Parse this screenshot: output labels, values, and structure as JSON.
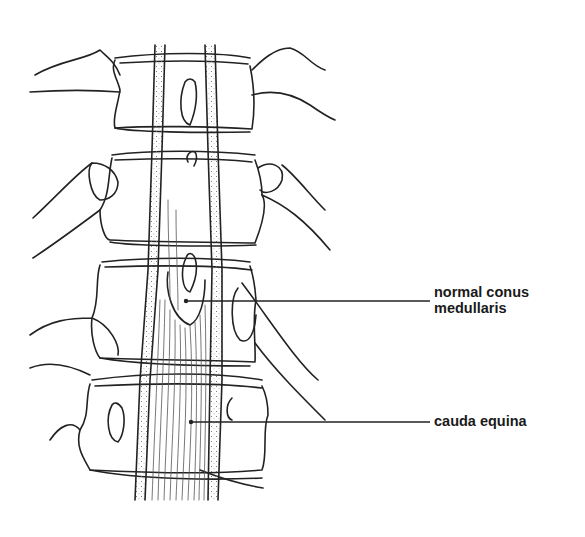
{
  "diagram": {
    "labels": [
      {
        "id": "conus",
        "line1": "normal conus",
        "line2": "medullaris"
      },
      {
        "id": "cauda",
        "line1": "cauda equina"
      }
    ],
    "colors": {
      "line": "#222222",
      "background": "#ffffff"
    }
  }
}
